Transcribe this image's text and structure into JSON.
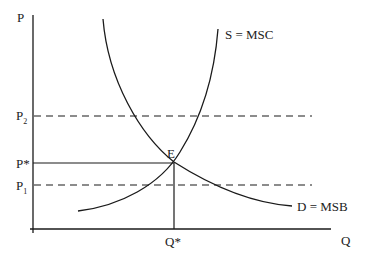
{
  "diagram": {
    "axes": {
      "y_label": "P",
      "x_label": "Q"
    },
    "price_levels": {
      "p2": {
        "base": "P",
        "sub": "2"
      },
      "p_star": "P*",
      "p1": {
        "base": "P",
        "sub": "1"
      }
    },
    "quantity_levels": {
      "q_star": "Q*"
    },
    "equilibrium_label": "E",
    "curves": {
      "supply": "S = MSC",
      "demand": "D = MSB"
    },
    "colors": {
      "line": "#1a1a1a",
      "background": "#ffffff"
    }
  }
}
